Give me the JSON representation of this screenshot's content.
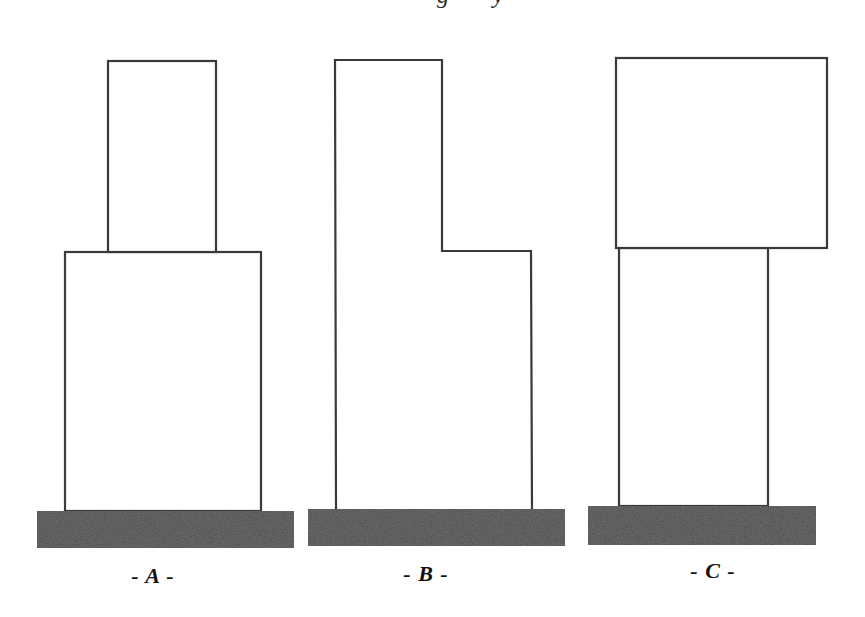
{
  "caption": {
    "visible_fragment": "g y",
    "note_clipped": true
  },
  "figures": [
    {
      "id": "A",
      "label": "- A -",
      "description": "Narrow box stacked on top of a wider box, centered",
      "upper_box": {
        "x": 108,
        "y": 61,
        "w": 108,
        "h": 191
      },
      "lower_box": {
        "x": 65,
        "y": 252,
        "w": 196,
        "h": 259
      },
      "base": {
        "x": 37,
        "y": 511,
        "w": 257,
        "h": 37
      },
      "label_pos": {
        "x": 153,
        "y": 563
      }
    },
    {
      "id": "B",
      "label": "- B -",
      "description": "Tall column with a lower side extension on the right (L-shaped profile)",
      "outline_points": [
        [
          336,
          509
        ],
        [
          335,
          60
        ],
        [
          442,
          60
        ],
        [
          442,
          251
        ],
        [
          531,
          251
        ],
        [
          532,
          509
        ]
      ],
      "base": {
        "x": 308,
        "y": 509,
        "w": 257,
        "h": 37
      },
      "label_pos": {
        "x": 426,
        "y": 561
      }
    },
    {
      "id": "C",
      "label": "- C -",
      "description": "Large box cantilevered on top of a narrower box (overhanging to the right)",
      "upper_box": {
        "x": 616,
        "y": 58,
        "w": 211,
        "h": 190
      },
      "lower_box": {
        "x": 619,
        "y": 248,
        "w": 149,
        "h": 258
      },
      "base": {
        "x": 588,
        "y": 506,
        "w": 228,
        "h": 39
      },
      "label_pos": {
        "x": 713,
        "y": 558
      }
    }
  ],
  "colors": {
    "outline": "#3a3a3a",
    "base_fill": "#4a4a4a",
    "background": "#ffffff",
    "label": "#111111"
  }
}
